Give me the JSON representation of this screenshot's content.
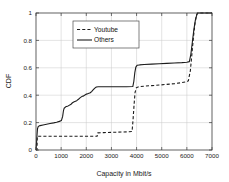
{
  "chart_data": {
    "type": "line",
    "title": "",
    "xlabel": "Capacity in Mbit/s",
    "ylabel": "CDF",
    "xlim": [
      0,
      7000
    ],
    "ylim": [
      0,
      1
    ],
    "grid": true,
    "legend_position": "upper-center-left",
    "xticks": [
      0,
      1000,
      2000,
      3000,
      4000,
      5000,
      6000,
      7000
    ],
    "xticklabels": [
      "0",
      "1000",
      "2000",
      "3000",
      "4000",
      "5000",
      "6000",
      "7000"
    ],
    "yticks": [
      0,
      0.2,
      0.4,
      0.6,
      0.8,
      1
    ],
    "yticklabels": [
      "0",
      "0.2",
      "0.4",
      "0.6",
      "0.8",
      "1"
    ],
    "series": [
      {
        "name": "Youtube",
        "style": "dashed",
        "color": "#1c1c1c",
        "points": [
          [
            0,
            0.0
          ],
          [
            40,
            0.0
          ],
          [
            50,
            0.1
          ],
          [
            300,
            0.1
          ],
          [
            700,
            0.1
          ],
          [
            1100,
            0.1
          ],
          [
            1500,
            0.1
          ],
          [
            1900,
            0.1
          ],
          [
            2300,
            0.1
          ],
          [
            2430,
            0.1
          ],
          [
            2450,
            0.125
          ],
          [
            2700,
            0.127
          ],
          [
            3000,
            0.129
          ],
          [
            3400,
            0.131
          ],
          [
            3700,
            0.133
          ],
          [
            3820,
            0.135
          ],
          [
            3860,
            0.22
          ],
          [
            3900,
            0.33
          ],
          [
            3940,
            0.42
          ],
          [
            3990,
            0.455
          ],
          [
            4100,
            0.462
          ],
          [
            4300,
            0.466
          ],
          [
            4600,
            0.47
          ],
          [
            4900,
            0.474
          ],
          [
            5200,
            0.479
          ],
          [
            5500,
            0.484
          ],
          [
            5800,
            0.492
          ],
          [
            6000,
            0.499
          ],
          [
            6060,
            0.505
          ],
          [
            6140,
            0.58
          ],
          [
            6200,
            0.7
          ],
          [
            6260,
            0.82
          ],
          [
            6320,
            0.92
          ],
          [
            6380,
            0.98
          ],
          [
            6420,
            1.0
          ],
          [
            7000,
            1.0
          ]
        ]
      },
      {
        "name": "Others",
        "style": "solid",
        "color": "#1c1c1c",
        "points": [
          [
            0,
            0.0
          ],
          [
            20,
            0.05
          ],
          [
            40,
            0.11
          ],
          [
            60,
            0.155
          ],
          [
            90,
            0.172
          ],
          [
            160,
            0.178
          ],
          [
            280,
            0.183
          ],
          [
            420,
            0.188
          ],
          [
            560,
            0.193
          ],
          [
            700,
            0.198
          ],
          [
            820,
            0.203
          ],
          [
            930,
            0.209
          ],
          [
            1010,
            0.215
          ],
          [
            1060,
            0.245
          ],
          [
            1090,
            0.285
          ],
          [
            1120,
            0.305
          ],
          [
            1180,
            0.315
          ],
          [
            1280,
            0.322
          ],
          [
            1380,
            0.332
          ],
          [
            1450,
            0.345
          ],
          [
            1520,
            0.352
          ],
          [
            1620,
            0.36
          ],
          [
            1700,
            0.372
          ],
          [
            1760,
            0.382
          ],
          [
            1820,
            0.39
          ],
          [
            1900,
            0.395
          ],
          [
            1960,
            0.403
          ],
          [
            2010,
            0.408
          ],
          [
            2080,
            0.412
          ],
          [
            2160,
            0.418
          ],
          [
            2220,
            0.428
          ],
          [
            2280,
            0.44
          ],
          [
            2340,
            0.452
          ],
          [
            2400,
            0.46
          ],
          [
            2480,
            0.462
          ],
          [
            2700,
            0.462
          ],
          [
            3000,
            0.462
          ],
          [
            3300,
            0.462
          ],
          [
            3600,
            0.462
          ],
          [
            3850,
            0.463
          ],
          [
            3890,
            0.5
          ],
          [
            3930,
            0.565
          ],
          [
            3970,
            0.605
          ],
          [
            4020,
            0.618
          ],
          [
            4120,
            0.621
          ],
          [
            4300,
            0.624
          ],
          [
            4600,
            0.627
          ],
          [
            4900,
            0.63
          ],
          [
            5200,
            0.632
          ],
          [
            5500,
            0.635
          ],
          [
            5800,
            0.638
          ],
          [
            6000,
            0.641
          ],
          [
            6100,
            0.645
          ],
          [
            6160,
            0.7
          ],
          [
            6220,
            0.79
          ],
          [
            6280,
            0.88
          ],
          [
            6340,
            0.95
          ],
          [
            6400,
            0.99
          ],
          [
            6440,
            1.0
          ],
          [
            7000,
            1.0
          ]
        ]
      }
    ]
  },
  "legend": {
    "items": [
      {
        "label": "Youtube",
        "style": "dashed"
      },
      {
        "label": "Others",
        "style": "solid"
      }
    ]
  },
  "axes": {
    "x_title": "Capacity in Mbit/s",
    "y_title": "CDF"
  }
}
